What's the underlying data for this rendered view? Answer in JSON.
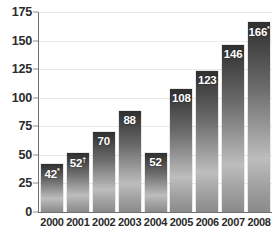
{
  "chart_data": {
    "type": "bar",
    "title": "",
    "subtitle": "",
    "xlabel": "",
    "ylabel": "",
    "categories": [
      "2000",
      "2001",
      "2002",
      "2003",
      "2004",
      "2005",
      "2006",
      "2007",
      "2008"
    ],
    "values": [
      42,
      52,
      70,
      88,
      52,
      108,
      123,
      146,
      166
    ],
    "point_labels": [
      "42",
      "52",
      "70",
      "88",
      "52",
      "108",
      "123",
      "146",
      "166"
    ],
    "point_markers": [
      "*",
      "†",
      "",
      "",
      "",
      "",
      "",
      "",
      "*"
    ],
    "ylim": [
      0,
      175
    ],
    "yticks": [
      0,
      25,
      50,
      75,
      100,
      125,
      150,
      175
    ],
    "ytick_labels": [
      "0",
      "25",
      "50",
      "75",
      "100",
      "125",
      "150",
      "175"
    ],
    "grid": true,
    "legend": false,
    "legend_position": "none",
    "bar_color_top": "#2f2f2f",
    "bar_color_mid": "#bdbdbd",
    "bar_color_bottom": "#8a8a8a",
    "axis_color": "#6e6e6e",
    "gridline_color": "#e9e9e9",
    "label_color": "#2b2b2b",
    "value_label_color": "#ffffff"
  }
}
